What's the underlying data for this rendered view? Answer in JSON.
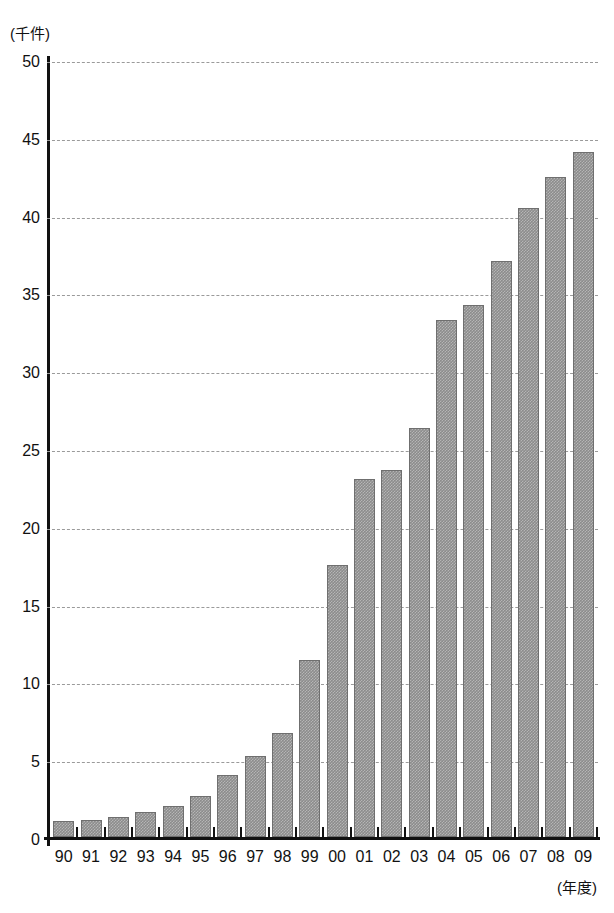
{
  "chart_data": {
    "type": "bar",
    "title": "",
    "subtitle": "",
    "xlabel": "(年度)",
    "ylabel": "(千件)",
    "categories": [
      "90",
      "91",
      "92",
      "93",
      "94",
      "95",
      "96",
      "97",
      "98",
      "99",
      "00",
      "01",
      "02",
      "03",
      "04",
      "05",
      "06",
      "07",
      "08",
      "09"
    ],
    "values": [
      1.2,
      1.3,
      1.5,
      1.8,
      2.2,
      2.8,
      4.2,
      5.4,
      6.9,
      11.6,
      17.7,
      23.2,
      23.8,
      26.5,
      33.4,
      34.4,
      37.2,
      40.6,
      42.6,
      44.2
    ],
    "ylim": [
      0,
      50
    ],
    "ytick_values": [
      0,
      5,
      10,
      15,
      20,
      25,
      30,
      35,
      40,
      45,
      50
    ],
    "ytick_labels": [
      "0",
      "5",
      "10",
      "15",
      "20",
      "25",
      "30",
      "35",
      "40",
      "45",
      "50"
    ],
    "grid": true,
    "grid_axis": "y",
    "grid_style": "dashed",
    "legend": false,
    "legend_position": "none",
    "series": [
      {
        "name": "",
        "values": [
          1.2,
          1.3,
          1.5,
          1.8,
          2.2,
          2.8,
          4.2,
          5.4,
          6.9,
          11.6,
          17.7,
          23.2,
          23.8,
          26.5,
          33.4,
          34.4,
          37.2,
          40.6,
          42.6,
          44.2
        ]
      }
    ],
    "bar_color": "#8c8c8c",
    "axis_color": "#111111",
    "grid_color": "#9a9a9a",
    "background": "#ffffff"
  }
}
